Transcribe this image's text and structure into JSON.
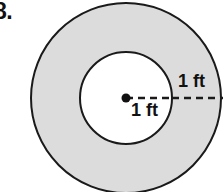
{
  "figure": {
    "problem_number": "8.",
    "shape": "annulus",
    "geometry": {
      "center_x": 126,
      "center_y": 98,
      "outer_radius": 95,
      "inner_radius": 46,
      "center_dot_radius": 4.5
    },
    "colors": {
      "ring_fill": "#dcdcdc",
      "inner_fill": "#ffffff",
      "stroke": "#1a1a1a",
      "text": "#111111",
      "background": "#ffffff"
    },
    "labels": {
      "inner_radius": "1 ft",
      "ring_width": "1 ft"
    },
    "dimension_lines": {
      "inner_radius_dash": {
        "x1": 126,
        "y1": 98,
        "x2": 172,
        "y2": 98
      },
      "ring_width_dash": {
        "x1": 172,
        "y1": 98,
        "x2": 223,
        "y2": 98
      }
    }
  }
}
